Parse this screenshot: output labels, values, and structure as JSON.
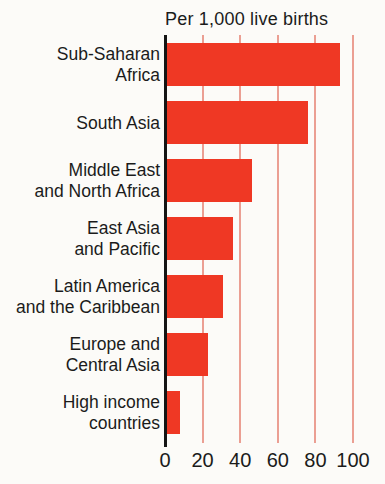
{
  "figure": {
    "kind": "scanned print bar chart",
    "background": "#fcfbf8"
  },
  "colors": {
    "bar": "#ef3824",
    "gridline": "#eb9f93",
    "axis": "#151515",
    "text": "#1b1b1b",
    "background": "#fcfbf8"
  },
  "chart_data": {
    "type": "bar",
    "orientation": "horizontal",
    "title": "Per 1,000 live births",
    "xlabel": "",
    "ylabel": "",
    "xlim": [
      0,
      100
    ],
    "xticks": [
      0,
      20,
      40,
      60,
      80,
      100
    ],
    "grid": "vertical gridlines at 20, 40, 60, 80, 100",
    "legend": "none",
    "categories": [
      "Sub-Saharan Africa",
      "South Asia",
      "Middle East and North Africa",
      "East Asia and Pacific",
      "Latin America and the Caribbean",
      "Europe and Central Asia",
      "High income countries"
    ],
    "category_lines": [
      [
        "Sub-Saharan",
        "Africa"
      ],
      [
        "South Asia"
      ],
      [
        "Middle East",
        "and North Africa"
      ],
      [
        "East Asia",
        "and Pacific"
      ],
      [
        "Latin America",
        "and the Caribbean"
      ],
      [
        "Europe and",
        "Central Asia"
      ],
      [
        "High income",
        "countries"
      ]
    ],
    "values": [
      92,
      75,
      45,
      35,
      30,
      22,
      7
    ]
  }
}
